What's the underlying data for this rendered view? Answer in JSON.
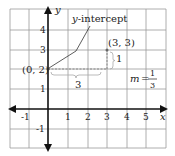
{
  "figure": {
    "axes": {
      "x_label": "x",
      "y_label": "y",
      "x_ticks": [
        "-1",
        "1",
        "2",
        "3",
        "4",
        "5"
      ],
      "y_ticks": [
        "4",
        "3",
        "2",
        "1",
        "-1"
      ]
    },
    "annotations": {
      "y_intercept_label": "y-intercept",
      "y_intercept_point": "(0, 2)",
      "second_point": "(3, 3)",
      "run": "3",
      "rise": "1",
      "slope_m": "m",
      "slope_eq": "=",
      "slope_num": "1",
      "slope_den": "3"
    },
    "colors": {
      "grid": "#999999",
      "axis": "#111111",
      "dashed": "#888888"
    }
  }
}
